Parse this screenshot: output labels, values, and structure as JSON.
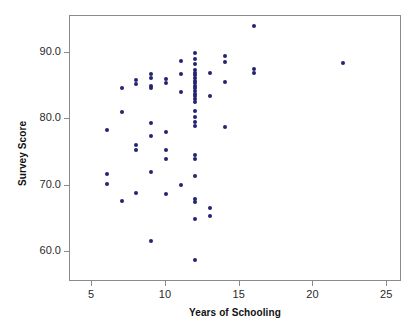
{
  "chart_data": {
    "type": "scatter",
    "title": "",
    "xlabel": "Years of Schooling",
    "ylabel": "Survey Score",
    "xlim": [
      3.5,
      26.0
    ],
    "ylim": [
      55.5,
      95.5
    ],
    "xticks": [
      5,
      10,
      15,
      20,
      25
    ],
    "xticklabels": [
      "5",
      "10",
      "15",
      "20",
      "25"
    ],
    "yticks": [
      60.0,
      70.0,
      80.0,
      90.0
    ],
    "yticklabels": [
      "60.0",
      "70.0",
      "80.0",
      "90.0"
    ],
    "grid": false,
    "legend": null,
    "marker": {
      "shape": "circle",
      "color": "#242470",
      "size_px": 4
    },
    "frame_color": "#8a8a8a",
    "background": "#ffffff",
    "n_points": 72,
    "points": [
      [
        6,
        78.4
      ],
      [
        6,
        71.8
      ],
      [
        6,
        70.3
      ],
      [
        7,
        84.7
      ],
      [
        7,
        81.1
      ],
      [
        7,
        67.7
      ],
      [
        8,
        85.9
      ],
      [
        8,
        85.3
      ],
      [
        8,
        76.1
      ],
      [
        8,
        75.4
      ],
      [
        8,
        68.9
      ],
      [
        9,
        86.8
      ],
      [
        9,
        86.2
      ],
      [
        9,
        85.0
      ],
      [
        9,
        84.7
      ],
      [
        9,
        79.4
      ],
      [
        9,
        77.4
      ],
      [
        9,
        72.0
      ],
      [
        9,
        61.6
      ],
      [
        10,
        86.0
      ],
      [
        10,
        85.5
      ],
      [
        10,
        78.0
      ],
      [
        10,
        75.4
      ],
      [
        10,
        74.0
      ],
      [
        10,
        68.7
      ],
      [
        11,
        88.8
      ],
      [
        11,
        86.8
      ],
      [
        11,
        84.1
      ],
      [
        11,
        70.1
      ],
      [
        12,
        90.0
      ],
      [
        12,
        89.0
      ],
      [
        12,
        88.3
      ],
      [
        12,
        87.4
      ],
      [
        12,
        87.0
      ],
      [
        12,
        86.6
      ],
      [
        12,
        86.2
      ],
      [
        12,
        85.8
      ],
      [
        12,
        85.4
      ],
      [
        12,
        85.0
      ],
      [
        12,
        84.6
      ],
      [
        12,
        84.2
      ],
      [
        12,
        83.8
      ],
      [
        12,
        83.4
      ],
      [
        12,
        83.0
      ],
      [
        12,
        82.6
      ],
      [
        12,
        81.2
      ],
      [
        12,
        80.3
      ],
      [
        12,
        79.5
      ],
      [
        12,
        79.0
      ],
      [
        12,
        74.6
      ],
      [
        12,
        74.0
      ],
      [
        12,
        71.4
      ],
      [
        12,
        68.0
      ],
      [
        12,
        67.5
      ],
      [
        12,
        64.9
      ],
      [
        12,
        58.8
      ],
      [
        13,
        86.9
      ],
      [
        13,
        83.4
      ],
      [
        13,
        66.6
      ],
      [
        13,
        65.4
      ],
      [
        14,
        89.5
      ],
      [
        14,
        88.6
      ],
      [
        14,
        85.6
      ],
      [
        14,
        78.8
      ],
      [
        16,
        94.0
      ],
      [
        16,
        87.6
      ],
      [
        16,
        86.9
      ],
      [
        22,
        88.5
      ]
    ]
  },
  "axes": {
    "x_title": "Years of Schooling",
    "y_title": "Survey Score"
  }
}
